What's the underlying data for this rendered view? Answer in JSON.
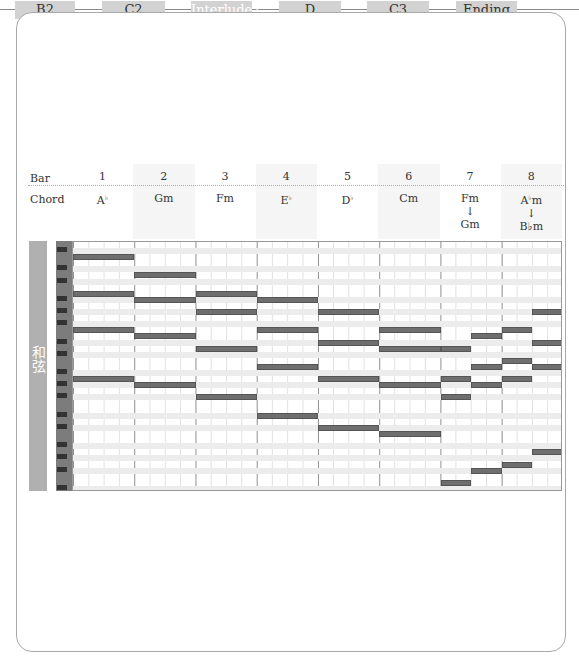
{
  "flow": {
    "sections": [
      {
        "label": "B2",
        "x": 15,
        "w": 60,
        "active": false
      },
      {
        "label": "C2",
        "x": 102,
        "w": 63,
        "active": false
      },
      {
        "label": "Interlude2",
        "x": 191,
        "w": 61,
        "active": true
      },
      {
        "label": "D",
        "x": 279,
        "w": 62,
        "active": false
      },
      {
        "label": "C3",
        "x": 367,
        "w": 62,
        "active": false
      },
      {
        "label": "Ending",
        "x": 456,
        "w": 61,
        "active": false
      }
    ]
  },
  "table": {
    "bar_label": "Bar",
    "chord_label": "Chord",
    "bars": [
      {
        "num": "1",
        "chord": "A",
        "acc": "b",
        "suffix": "",
        "chord2": ""
      },
      {
        "num": "2",
        "chord": "Gm",
        "acc": "",
        "suffix": "",
        "chord2": ""
      },
      {
        "num": "3",
        "chord": "Fm",
        "acc": "",
        "suffix": "",
        "chord2": ""
      },
      {
        "num": "4",
        "chord": "E",
        "acc": "b",
        "suffix": "",
        "chord2": ""
      },
      {
        "num": "5",
        "chord": "D",
        "acc": "b",
        "suffix": "",
        "chord2": ""
      },
      {
        "num": "6",
        "chord": "Cm",
        "acc": "",
        "suffix": "",
        "chord2": ""
      },
      {
        "num": "7",
        "chord": "Fm",
        "acc": "",
        "suffix": "",
        "arrow": "↓",
        "chord2": "Gm"
      },
      {
        "num": "8",
        "chord": "A",
        "acc": "b",
        "suffix": "m",
        "arrow": "↓",
        "chord2": "B♭m"
      }
    ]
  },
  "side_label": "和弦",
  "chart_data": {
    "type": "piano-roll",
    "bars": [
      "1",
      "2",
      "3",
      "4",
      "5",
      "6",
      "7",
      "8"
    ],
    "chords": [
      "A♭",
      "Gm",
      "Fm",
      "E♭",
      "D♭",
      "Cm",
      "Fm→Gm",
      "A♭m→B♭m"
    ],
    "grid": {
      "rows": 41,
      "bars": 8,
      "subdivisions_per_bar": 4
    },
    "notes": [
      {
        "bar": 1,
        "start": 0,
        "len": 1,
        "row": 2
      },
      {
        "bar": 1,
        "start": 0,
        "len": 1,
        "row": 8
      },
      {
        "bar": 1,
        "start": 0,
        "len": 1,
        "row": 14
      },
      {
        "bar": 1,
        "start": 0,
        "len": 1,
        "row": 22
      },
      {
        "bar": 2,
        "start": 0,
        "len": 1,
        "row": 5
      },
      {
        "bar": 2,
        "start": 0,
        "len": 1,
        "row": 9
      },
      {
        "bar": 2,
        "start": 0,
        "len": 1,
        "row": 15
      },
      {
        "bar": 2,
        "start": 0,
        "len": 1,
        "row": 23
      },
      {
        "bar": 3,
        "start": 0,
        "len": 1,
        "row": 8
      },
      {
        "bar": 3,
        "start": 0,
        "len": 1,
        "row": 11
      },
      {
        "bar": 3,
        "start": 0,
        "len": 1,
        "row": 17
      },
      {
        "bar": 3,
        "start": 0,
        "len": 1,
        "row": 25
      },
      {
        "bar": 4,
        "start": 0,
        "len": 1,
        "row": 9
      },
      {
        "bar": 4,
        "start": 0,
        "len": 1,
        "row": 14
      },
      {
        "bar": 4,
        "start": 0,
        "len": 1,
        "row": 20
      },
      {
        "bar": 4,
        "start": 0,
        "len": 1,
        "row": 28
      },
      {
        "bar": 5,
        "start": 0,
        "len": 1,
        "row": 11
      },
      {
        "bar": 5,
        "start": 0,
        "len": 1,
        "row": 16
      },
      {
        "bar": 5,
        "start": 0,
        "len": 1,
        "row": 22
      },
      {
        "bar": 5,
        "start": 0,
        "len": 1,
        "row": 30
      },
      {
        "bar": 6,
        "start": 0,
        "len": 1,
        "row": 14
      },
      {
        "bar": 6,
        "start": 0,
        "len": 1,
        "row": 17
      },
      {
        "bar": 6,
        "start": 0,
        "len": 1,
        "row": 23
      },
      {
        "bar": 6,
        "start": 0,
        "len": 1,
        "row": 31
      },
      {
        "bar": 7,
        "start": 0,
        "len": 0.5,
        "row": 17
      },
      {
        "bar": 7,
        "start": 0,
        "len": 0.5,
        "row": 22
      },
      {
        "bar": 7,
        "start": 0,
        "len": 0.5,
        "row": 25
      },
      {
        "bar": 7,
        "start": 0,
        "len": 0.5,
        "row": 39
      },
      {
        "bar": 7,
        "start": 0.5,
        "len": 0.5,
        "row": 15
      },
      {
        "bar": 7,
        "start": 0.5,
        "len": 0.5,
        "row": 20
      },
      {
        "bar": 7,
        "start": 0.5,
        "len": 0.5,
        "row": 23
      },
      {
        "bar": 7,
        "start": 0.5,
        "len": 0.5,
        "row": 37
      },
      {
        "bar": 8,
        "start": 0,
        "len": 0.5,
        "row": 14
      },
      {
        "bar": 8,
        "start": 0,
        "len": 0.5,
        "row": 19
      },
      {
        "bar": 8,
        "start": 0,
        "len": 0.5,
        "row": 22
      },
      {
        "bar": 8,
        "start": 0,
        "len": 0.5,
        "row": 36
      },
      {
        "bar": 8,
        "start": 0.5,
        "len": 0.5,
        "row": 11
      },
      {
        "bar": 8,
        "start": 0.5,
        "len": 0.5,
        "row": 16
      },
      {
        "bar": 8,
        "start": 0.5,
        "len": 0.5,
        "row": 20
      },
      {
        "bar": 8,
        "start": 0.5,
        "len": 0.5,
        "row": 34
      }
    ],
    "black_key_rows": [
      1,
      4,
      6,
      9,
      11,
      13,
      16,
      18,
      21,
      23,
      25,
      28,
      30,
      33,
      35,
      37,
      40
    ]
  }
}
